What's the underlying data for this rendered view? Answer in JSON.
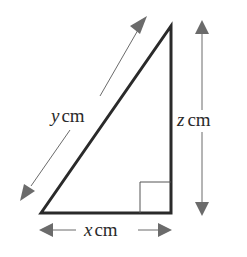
{
  "diagram": {
    "type": "right-triangle",
    "colors": {
      "triangle_stroke": "#2a2a2a",
      "arrow": "#6b6b6b",
      "label": "#2a2a2a",
      "background": "#ffffff"
    },
    "labels": {
      "hypotenuse": {
        "var": "y",
        "unit": "cm"
      },
      "vertical_side": {
        "var": "z",
        "unit": "cm"
      },
      "horizontal_side": {
        "var": "x",
        "unit": "cm"
      }
    },
    "right_angle_marker": "bottom-right"
  }
}
